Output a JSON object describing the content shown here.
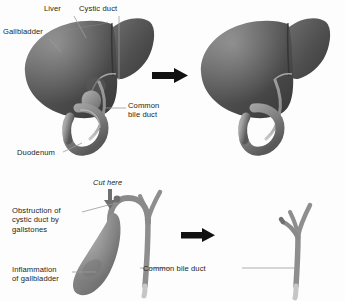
{
  "figure": {
    "background_color": "#fdfdfd",
    "ink_color": "#231f20",
    "leader_color": "#9a9a9a",
    "organ_dark": "#4a4a4a",
    "organ_mid": "#6d6d6d",
    "organ_light": "#9b9b9b",
    "duct_gray": "#8c8c8c",
    "arrow_color": "#111111"
  },
  "panels": {
    "top_left": {
      "name": "liver-with-gallbladder",
      "labels": [
        {
          "id": "liver",
          "text": "Liver"
        },
        {
          "id": "cystic_duct",
          "text": "Cystic duct"
        },
        {
          "id": "gallbladder",
          "text": "Gallbladder"
        },
        {
          "id": "common_bile_duct",
          "text": "Common\nbile duct"
        },
        {
          "id": "duodenum",
          "text": "Duodenum"
        }
      ]
    },
    "top_right": {
      "name": "liver-after-removal",
      "labels": []
    },
    "bottom_left": {
      "name": "obstructed-gallbladder-detail",
      "labels": [
        {
          "id": "cut_here",
          "text": "Cut here",
          "style": "italic"
        },
        {
          "id": "obstruction",
          "text": "Obstruction of\ncystic duct by\ngallstones"
        },
        {
          "id": "inflammation",
          "text": "Inflammation\nof gallbladder"
        }
      ]
    },
    "bottom_right": {
      "name": "duct-tree-after-removal",
      "labels": [
        {
          "id": "common_bile_duct_2",
          "text": "Common bile duct"
        }
      ]
    }
  },
  "arrows": {
    "top_transition": {
      "direction": "right",
      "color": "#111111"
    },
    "bottom_transition": {
      "direction": "right",
      "color": "#111111"
    },
    "cut_marker": {
      "direction": "down",
      "color": "#6f6f6f"
    }
  }
}
